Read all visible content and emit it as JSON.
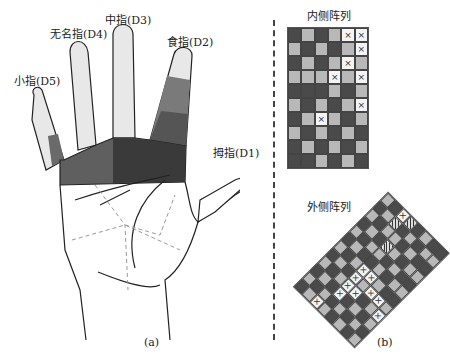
{
  "panel_a": {
    "caption": "(a)",
    "fingers": [
      {
        "id": "D5",
        "label": "小指(D5)",
        "segments": [
          "1",
          "2",
          "3",
          "4",
          "5",
          "6",
          "7",
          "8"
        ]
      },
      {
        "id": "D4",
        "label": "无名指(D4)",
        "segments": [
          "1",
          "2",
          "3",
          "4",
          "5",
          "6",
          "7",
          "8"
        ]
      },
      {
        "id": "D3",
        "label": "中指(D3)",
        "segments": [
          "1",
          "2",
          "3",
          "4",
          "5",
          "6",
          "7",
          "8"
        ]
      },
      {
        "id": "D2",
        "label": "食指(D2)",
        "segments": [
          "1",
          "2",
          "3",
          "4",
          "5",
          "6",
          "7",
          "8"
        ]
      },
      {
        "id": "D1",
        "label": "拇指(D1)",
        "segments": [
          "1",
          "2",
          "3",
          "4",
          "5",
          "6"
        ]
      }
    ],
    "palm_regions": [
      "P0",
      "P1",
      "P3",
      "P4",
      "P5",
      "P6",
      "P7",
      "P8",
      "P9",
      "P10"
    ]
  },
  "panel_b": {
    "caption": "(b)",
    "inner_array": {
      "title": "内侧阵列",
      "rows": 10,
      "cols": 6,
      "cells": [
        "d",
        "m",
        "d",
        "m",
        "x",
        "x",
        "m",
        "d",
        "m",
        "d",
        "m",
        "x",
        "d",
        "m",
        "d",
        "m",
        "x",
        "m",
        "m",
        "m",
        "m",
        "x",
        "m",
        "x",
        "d",
        "d",
        "d",
        "m",
        "d",
        "m",
        "m",
        "d",
        "m",
        "d",
        "m",
        "x",
        "d",
        "m",
        "x",
        "m",
        "d",
        "m",
        "m",
        "d",
        "m",
        "d",
        "m",
        "d",
        "d",
        "m",
        "d",
        "m",
        "d",
        "m",
        "d",
        "d",
        "m",
        "d",
        "m",
        "d"
      ]
    },
    "outer_array": {
      "title": "外侧阵列",
      "rows": 8,
      "cols": 12,
      "cells": [
        "d",
        "m",
        "d",
        "m",
        "d",
        "m",
        "d",
        "m",
        "d",
        "m",
        "d",
        "m",
        "m",
        "d",
        "m",
        "d",
        "m",
        "d",
        "m",
        "d",
        "m",
        "d",
        "m",
        "d",
        "x",
        "m",
        "d",
        "m",
        "d",
        "m",
        "d",
        "m",
        "d",
        "m",
        "h",
        "x",
        "m",
        "d",
        "x",
        "x",
        "x",
        "x",
        "d",
        "m",
        "h",
        "m",
        "d",
        "h",
        "d",
        "m",
        "d",
        "x",
        "m",
        "x",
        "m",
        "d",
        "m",
        "d",
        "m",
        "d",
        "m",
        "d",
        "m",
        "d",
        "x",
        "m",
        "d",
        "m",
        "d",
        "m",
        "d",
        "m",
        "d",
        "m",
        "d",
        "m",
        "x",
        "d",
        "m",
        "d",
        "m",
        "d",
        "m",
        "d",
        "m",
        "d",
        "m",
        "x",
        "m",
        "d",
        "m",
        "d",
        "m",
        "d",
        "m",
        "d"
      ]
    }
  },
  "colors": {
    "dark": "#4a4a4a",
    "mid": "#8a8a8a",
    "light": "#b8b8b8",
    "x_cell": "#f4f4f4",
    "palm_dark": "#3a3a3a",
    "palm_mid": "#5f5f5f",
    "finger_fill": "#e8e8e8"
  }
}
